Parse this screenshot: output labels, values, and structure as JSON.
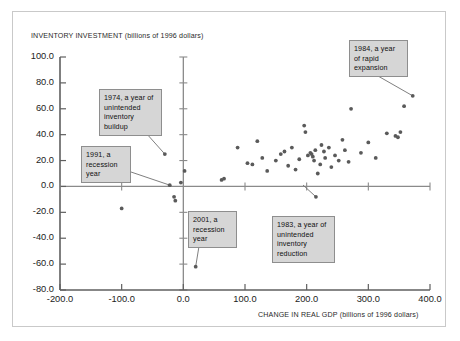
{
  "chart_data": {
    "type": "scatter",
    "title": "",
    "xlabel": "CHANGE IN REAL GDP (billions of 1996 dollars)",
    "ylabel": "INVENTORY INVESTMENT (billions of 1996 dollars)",
    "xlim": [
      -200.0,
      400.0
    ],
    "ylim": [
      -80.0,
      100.0
    ],
    "xticks": [
      "-200.0",
      "-100.0",
      "0.0",
      "100.0",
      "200.0",
      "300.0",
      "400.0"
    ],
    "yticks": [
      "100.0",
      "80.0",
      "60.0",
      "40.0",
      "20.0",
      "0.0",
      "-20.0",
      "-40.0",
      "-60.0",
      "-80.0"
    ],
    "xtick_values": [
      -200,
      -100,
      0,
      100,
      200,
      300,
      400
    ],
    "ytick_values": [
      100,
      80,
      60,
      40,
      20,
      0,
      -20,
      -40,
      -60,
      -80
    ],
    "grid": false,
    "legend": null,
    "point_color": "#5a5a5a",
    "axis_color": "#8a8a8a",
    "points": [
      [
        -100,
        -17
      ],
      [
        -30,
        25
      ],
      [
        -22,
        1
      ],
      [
        -15,
        -8
      ],
      [
        -13,
        -11
      ],
      [
        -4,
        3
      ],
      [
        2,
        12
      ],
      [
        20,
        -62
      ],
      [
        62,
        5
      ],
      [
        66,
        6
      ],
      [
        88,
        30
      ],
      [
        104,
        18
      ],
      [
        112,
        17
      ],
      [
        120,
        35
      ],
      [
        128,
        22
      ],
      [
        136,
        12
      ],
      [
        150,
        20
      ],
      [
        158,
        25
      ],
      [
        164,
        27
      ],
      [
        170,
        16
      ],
      [
        176,
        30
      ],
      [
        182,
        13
      ],
      [
        188,
        21
      ],
      [
        196,
        47
      ],
      [
        198,
        42
      ],
      [
        202,
        24
      ],
      [
        206,
        26
      ],
      [
        208,
        25
      ],
      [
        210,
        23
      ],
      [
        212,
        20
      ],
      [
        214,
        28
      ],
      [
        215,
        -8
      ],
      [
        218,
        10
      ],
      [
        222,
        17
      ],
      [
        224,
        32
      ],
      [
        228,
        27
      ],
      [
        230,
        22
      ],
      [
        236,
        30
      ],
      [
        240,
        15
      ],
      [
        246,
        24
      ],
      [
        252,
        20
      ],
      [
        258,
        36
      ],
      [
        262,
        28
      ],
      [
        268,
        19
      ],
      [
        272,
        60
      ],
      [
        288,
        26
      ],
      [
        300,
        34
      ],
      [
        312,
        22
      ],
      [
        330,
        41
      ],
      [
        344,
        39
      ],
      [
        348,
        38
      ],
      [
        352,
        42
      ],
      [
        358,
        62
      ],
      [
        372,
        70
      ]
    ]
  },
  "callouts": [
    {
      "id": "1974",
      "text": "1974, a year of unintended inventory buildup",
      "target": [
        -30,
        25
      ]
    },
    {
      "id": "1991",
      "text": "1991, a recession year",
      "target": [
        -22,
        1
      ]
    },
    {
      "id": "1984",
      "text": "1984, a year of rapid expansion",
      "target": [
        372,
        70
      ]
    },
    {
      "id": "2001",
      "text": "2001, a recession year",
      "target": [
        20,
        -62
      ]
    },
    {
      "id": "1983",
      "text": "1983, a year of unintended inventory reduction",
      "target": [
        215,
        -8
      ]
    }
  ]
}
